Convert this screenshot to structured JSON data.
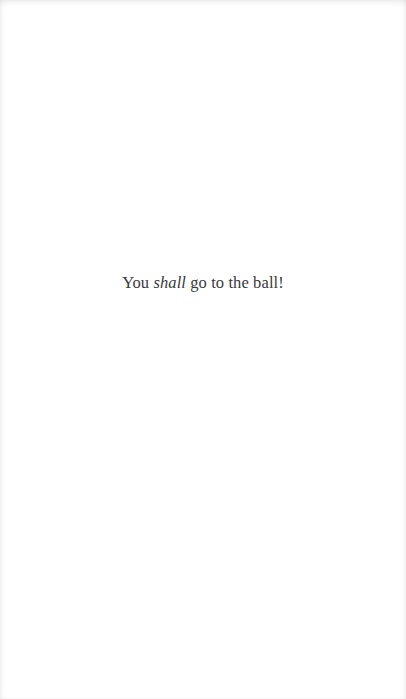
{
  "page": {
    "text_before": "You ",
    "emphasis": "shall",
    "text_after": " go to the ball!",
    "text_color": "#3a3a3a",
    "background": "#ffffff"
  }
}
